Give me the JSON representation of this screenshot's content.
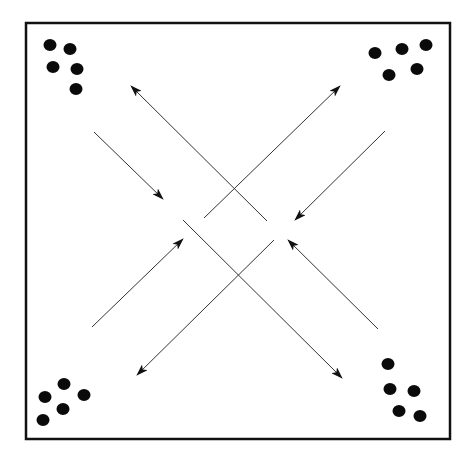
{
  "diagram": {
    "colors": {
      "background": "#ffffff",
      "stroke": "#111111",
      "line": "#333333",
      "dot": "#0a0a0a"
    },
    "border": {
      "x": 26,
      "y": 23,
      "width": 424,
      "height": 416
    },
    "dot_groups": [
      {
        "corner": "top-left",
        "dots": [
          [
            50,
            45
          ],
          [
            70,
            49
          ],
          [
            53,
            67
          ],
          [
            77,
            69
          ],
          [
            76,
            89
          ]
        ]
      },
      {
        "corner": "top-right",
        "dots": [
          [
            375,
            53
          ],
          [
            402,
            49
          ],
          [
            426,
            45
          ],
          [
            389,
            75
          ],
          [
            417,
            69
          ]
        ]
      },
      {
        "corner": "bottom-left",
        "dots": [
          [
            64,
            384
          ],
          [
            45,
            397
          ],
          [
            84,
            395
          ],
          [
            63,
            409
          ],
          [
            43,
            420
          ]
        ]
      },
      {
        "corner": "bottom-right",
        "dots": [
          [
            388,
            364
          ],
          [
            390,
            389
          ],
          [
            414,
            391
          ],
          [
            399,
            411
          ],
          [
            420,
            416
          ]
        ]
      }
    ],
    "arrows": [
      {
        "name": "short-arrow-nw-inward",
        "from": [
          94,
          132
        ],
        "to": [
          163,
          199
        ]
      },
      {
        "name": "long-arrow-to-top-left",
        "from": [
          267,
          221
        ],
        "to": [
          131,
          86
        ]
      },
      {
        "name": "long-arrow-to-top-right",
        "from": [
          204,
          218
        ],
        "to": [
          340,
          86
        ]
      },
      {
        "name": "short-arrow-ne-inward",
        "from": [
          385,
          131
        ],
        "to": [
          295,
          220
        ]
      },
      {
        "name": "short-arrow-sw-inward",
        "from": [
          92,
          327
        ],
        "to": [
          183,
          239
        ]
      },
      {
        "name": "long-arrow-to-bottom-left",
        "from": [
          274,
          240
        ],
        "to": [
          137,
          375
        ]
      },
      {
        "name": "long-arrow-to-bottom-right",
        "from": [
          183,
          220
        ],
        "to": [
          342,
          378
        ]
      },
      {
        "name": "short-arrow-se-inward",
        "from": [
          378,
          329
        ],
        "to": [
          288,
          240
        ]
      }
    ]
  }
}
